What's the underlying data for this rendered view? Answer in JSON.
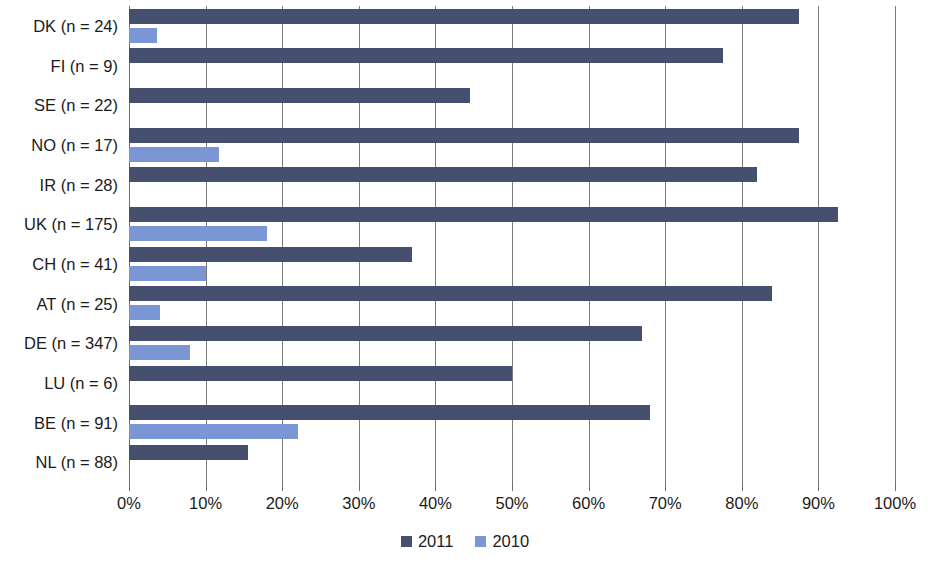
{
  "chart_data": {
    "type": "bar",
    "orientation": "horizontal",
    "title": "",
    "subtitle": "",
    "xlabel": "",
    "ylabel": "",
    "xlim": [
      0,
      100
    ],
    "xticks": [
      0,
      10,
      20,
      30,
      40,
      50,
      60,
      70,
      80,
      90,
      100
    ],
    "xtick_labels": [
      "0%",
      "10%",
      "20%",
      "30%",
      "40%",
      "50%",
      "60%",
      "70%",
      "80%",
      "90%",
      "100%"
    ],
    "grid": true,
    "legend_position": "bottom",
    "categories": [
      "DK (n = 24)",
      "FI (n = 9)",
      "SE (n = 22)",
      "NO (n = 17)",
      "IR (n = 28)",
      "UK (n = 175)",
      "CH (n = 41)",
      "AT (n = 25)",
      "DE (n = 347)",
      "LU (n = 6)",
      "BE (n = 91)",
      "NL (n = 88)"
    ],
    "series": [
      {
        "name": "2011",
        "color": "#46506e",
        "values": [
          87.5,
          77.5,
          44.5,
          87.5,
          82.0,
          92.5,
          37.0,
          84.0,
          67.0,
          50.0,
          68.0,
          15.5
        ]
      },
      {
        "name": "2010",
        "color": "#7b96d4",
        "values": [
          3.7,
          0,
          0,
          11.8,
          0,
          18.0,
          10.0,
          4.0,
          8.0,
          0,
          22.0,
          0
        ]
      }
    ]
  },
  "legend": {
    "items": [
      {
        "label": "2011",
        "color": "#46506e"
      },
      {
        "label": "2010",
        "color": "#7b96d4"
      }
    ]
  }
}
